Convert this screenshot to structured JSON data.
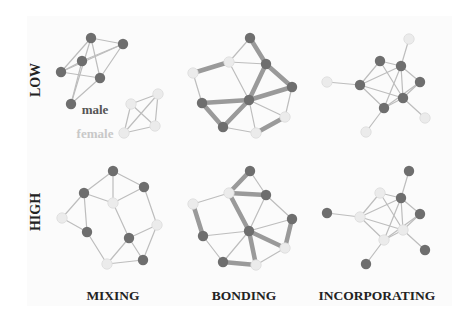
{
  "colors": {
    "male": "#6e6e6e",
    "female": "#ebebeb",
    "female_stroke": "#dcdcdc",
    "thin_edge": "#bdbdbd",
    "thick_edge": "#9a9a9a",
    "panel_bg": "#fbfbfb"
  },
  "row_labels": [
    {
      "text": "LOW",
      "x": 40,
      "y": 80
    },
    {
      "text": "HIGH",
      "x": 40,
      "y": 212
    }
  ],
  "column_labels": [
    {
      "text": "MIXING",
      "x": 113,
      "y": 300
    },
    {
      "text": "BONDING",
      "x": 244,
      "y": 300
    },
    {
      "text": "INCORPORATING",
      "x": 377,
      "y": 300
    }
  ],
  "legend": {
    "male_label": "male",
    "female_label": "female"
  },
  "networks": [
    {
      "id": "low-mixing",
      "nodes": [
        {
          "x": 91,
          "y": 38,
          "g": "m"
        },
        {
          "x": 123,
          "y": 44,
          "g": "m"
        },
        {
          "x": 82,
          "y": 61,
          "g": "m"
        },
        {
          "x": 61,
          "y": 72,
          "g": "m"
        },
        {
          "x": 100,
          "y": 78,
          "g": "m"
        },
        {
          "x": 71,
          "y": 104,
          "g": "m"
        },
        {
          "x": 131,
          "y": 104,
          "g": "f"
        },
        {
          "x": 158,
          "y": 94,
          "g": "f"
        },
        {
          "x": 155,
          "y": 126,
          "g": "f"
        },
        {
          "x": 124,
          "y": 133,
          "g": "f"
        }
      ],
      "edges": [
        [
          0,
          1,
          0
        ],
        [
          0,
          3,
          0
        ],
        [
          0,
          4,
          0
        ],
        [
          0,
          5,
          0
        ],
        [
          1,
          2,
          0
        ],
        [
          1,
          4,
          0
        ],
        [
          2,
          3,
          0
        ],
        [
          2,
          5,
          0
        ],
        [
          3,
          4,
          0
        ],
        [
          4,
          5,
          0
        ],
        [
          1,
          3,
          0
        ],
        [
          6,
          7,
          0
        ],
        [
          6,
          8,
          0
        ],
        [
          6,
          9,
          0
        ],
        [
          7,
          8,
          0
        ],
        [
          7,
          9,
          0
        ],
        [
          8,
          9,
          0
        ]
      ]
    },
    {
      "id": "low-bonding",
      "nodes": [
        {
          "x": 250,
          "y": 38,
          "g": "m"
        },
        {
          "x": 229,
          "y": 62,
          "g": "f"
        },
        {
          "x": 266,
          "y": 64,
          "g": "m"
        },
        {
          "x": 193,
          "y": 73,
          "g": "f"
        },
        {
          "x": 292,
          "y": 87,
          "g": "m"
        },
        {
          "x": 202,
          "y": 103,
          "g": "m"
        },
        {
          "x": 249,
          "y": 100,
          "g": "m"
        },
        {
          "x": 285,
          "y": 117,
          "g": "f"
        },
        {
          "x": 223,
          "y": 127,
          "g": "m"
        },
        {
          "x": 256,
          "y": 133,
          "g": "f"
        }
      ],
      "edges": [
        [
          0,
          1,
          0
        ],
        [
          0,
          2,
          1
        ],
        [
          1,
          3,
          1
        ],
        [
          1,
          2,
          0
        ],
        [
          1,
          6,
          0
        ],
        [
          2,
          6,
          1
        ],
        [
          2,
          4,
          1
        ],
        [
          4,
          6,
          1
        ],
        [
          4,
          7,
          0
        ],
        [
          3,
          5,
          0
        ],
        [
          5,
          6,
          1
        ],
        [
          5,
          8,
          1
        ],
        [
          8,
          6,
          1
        ],
        [
          6,
          7,
          0
        ],
        [
          6,
          9,
          0
        ],
        [
          8,
          9,
          0
        ],
        [
          9,
          7,
          1
        ]
      ]
    },
    {
      "id": "low-incorporating",
      "nodes": [
        {
          "x": 409,
          "y": 39,
          "g": "f"
        },
        {
          "x": 380,
          "y": 61,
          "g": "m"
        },
        {
          "x": 401,
          "y": 66,
          "g": "m"
        },
        {
          "x": 420,
          "y": 82,
          "g": "m"
        },
        {
          "x": 360,
          "y": 85,
          "g": "m"
        },
        {
          "x": 403,
          "y": 98,
          "g": "m"
        },
        {
          "x": 384,
          "y": 108,
          "g": "m"
        },
        {
          "x": 327,
          "y": 82,
          "g": "f"
        },
        {
          "x": 425,
          "y": 118,
          "g": "f"
        },
        {
          "x": 366,
          "y": 132,
          "g": "f"
        }
      ],
      "edges": [
        [
          0,
          2,
          0
        ],
        [
          1,
          2,
          0
        ],
        [
          1,
          4,
          0
        ],
        [
          1,
          5,
          0
        ],
        [
          2,
          4,
          0
        ],
        [
          2,
          3,
          0
        ],
        [
          2,
          5,
          0
        ],
        [
          2,
          6,
          0
        ],
        [
          3,
          5,
          0
        ],
        [
          3,
          6,
          0
        ],
        [
          4,
          5,
          0
        ],
        [
          4,
          6,
          0
        ],
        [
          5,
          6,
          0
        ],
        [
          7,
          4,
          0
        ],
        [
          5,
          8,
          0
        ],
        [
          6,
          9,
          0
        ]
      ]
    },
    {
      "id": "high-mixing",
      "nodes": [
        {
          "x": 113,
          "y": 171,
          "g": "m"
        },
        {
          "x": 144,
          "y": 187,
          "g": "m"
        },
        {
          "x": 84,
          "y": 193,
          "g": "m"
        },
        {
          "x": 113,
          "y": 203,
          "g": "f"
        },
        {
          "x": 62,
          "y": 218,
          "g": "f"
        },
        {
          "x": 157,
          "y": 225,
          "g": "f"
        },
        {
          "x": 87,
          "y": 232,
          "g": "m"
        },
        {
          "x": 129,
          "y": 238,
          "g": "m"
        },
        {
          "x": 107,
          "y": 264,
          "g": "f"
        },
        {
          "x": 143,
          "y": 260,
          "g": "m"
        }
      ],
      "edges": [
        [
          0,
          2,
          0
        ],
        [
          0,
          1,
          0
        ],
        [
          0,
          3,
          0
        ],
        [
          2,
          3,
          0
        ],
        [
          2,
          4,
          0
        ],
        [
          2,
          6,
          0
        ],
        [
          4,
          6,
          0
        ],
        [
          1,
          3,
          0
        ],
        [
          1,
          5,
          0
        ],
        [
          3,
          7,
          0
        ],
        [
          6,
          8,
          0
        ],
        [
          7,
          8,
          0
        ],
        [
          7,
          5,
          0
        ],
        [
          7,
          9,
          0
        ],
        [
          8,
          9,
          0
        ],
        [
          5,
          9,
          0
        ]
      ]
    },
    {
      "id": "high-bonding",
      "nodes": [
        {
          "x": 250,
          "y": 171,
          "g": "m"
        },
        {
          "x": 229,
          "y": 193,
          "g": "f"
        },
        {
          "x": 266,
          "y": 195,
          "g": "m"
        },
        {
          "x": 193,
          "y": 204,
          "g": "f"
        },
        {
          "x": 292,
          "y": 219,
          "g": "m"
        },
        {
          "x": 203,
          "y": 236,
          "g": "m"
        },
        {
          "x": 249,
          "y": 231,
          "g": "m"
        },
        {
          "x": 285,
          "y": 248,
          "g": "f"
        },
        {
          "x": 223,
          "y": 262,
          "g": "m"
        },
        {
          "x": 256,
          "y": 265,
          "g": "f"
        }
      ],
      "edges": [
        [
          0,
          1,
          1
        ],
        [
          0,
          2,
          0
        ],
        [
          1,
          2,
          1
        ],
        [
          1,
          3,
          0
        ],
        [
          1,
          6,
          1
        ],
        [
          2,
          6,
          0
        ],
        [
          2,
          4,
          0
        ],
        [
          3,
          5,
          1
        ],
        [
          5,
          6,
          0
        ],
        [
          5,
          8,
          0
        ],
        [
          4,
          6,
          0
        ],
        [
          4,
          7,
          1
        ],
        [
          6,
          7,
          1
        ],
        [
          6,
          8,
          0
        ],
        [
          6,
          9,
          1
        ],
        [
          8,
          9,
          1
        ],
        [
          9,
          7,
          0
        ]
      ]
    },
    {
      "id": "high-incorporating",
      "nodes": [
        {
          "x": 409,
          "y": 171,
          "g": "m"
        },
        {
          "x": 380,
          "y": 193,
          "g": "f"
        },
        {
          "x": 401,
          "y": 198,
          "g": "m"
        },
        {
          "x": 420,
          "y": 214,
          "g": "m"
        },
        {
          "x": 360,
          "y": 217,
          "g": "f"
        },
        {
          "x": 403,
          "y": 230,
          "g": "f"
        },
        {
          "x": 384,
          "y": 240,
          "g": "f"
        },
        {
          "x": 327,
          "y": 213,
          "g": "m"
        },
        {
          "x": 425,
          "y": 250,
          "g": "m"
        },
        {
          "x": 366,
          "y": 264,
          "g": "m"
        }
      ],
      "edges": [
        [
          0,
          2,
          0
        ],
        [
          1,
          2,
          0
        ],
        [
          1,
          4,
          0
        ],
        [
          1,
          5,
          0
        ],
        [
          2,
          4,
          0
        ],
        [
          2,
          3,
          0
        ],
        [
          2,
          5,
          0
        ],
        [
          2,
          6,
          0
        ],
        [
          3,
          5,
          0
        ],
        [
          3,
          6,
          0
        ],
        [
          4,
          5,
          0
        ],
        [
          4,
          6,
          0
        ],
        [
          5,
          6,
          0
        ],
        [
          7,
          4,
          0
        ],
        [
          5,
          8,
          0
        ],
        [
          6,
          9,
          0
        ]
      ]
    }
  ]
}
